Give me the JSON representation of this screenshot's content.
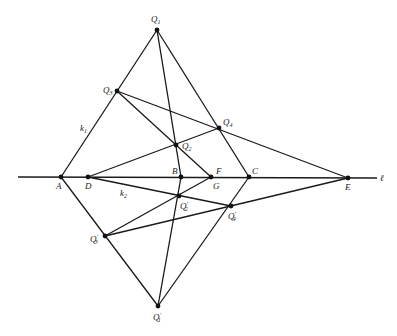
{
  "diagram": {
    "type": "projective-geometry-construction",
    "line_label": "ℓ",
    "line_names": {
      "k1": "k",
      "k1_sub": "1",
      "k2": "k",
      "k2_sub": "2"
    },
    "points": [
      {
        "id": "Q1",
        "label": "Q",
        "sub": "1",
        "prime": "",
        "x": 157,
        "y": 30
      },
      {
        "id": "Q3",
        "label": "Q",
        "sub": "3",
        "prime": "",
        "x": 117,
        "y": 91
      },
      {
        "id": "Q4",
        "label": "Q",
        "sub": "4",
        "prime": "",
        "x": 219,
        "y": 128
      },
      {
        "id": "Q2",
        "label": "Q",
        "sub": "2",
        "prime": "",
        "x": 176,
        "y": 145
      },
      {
        "id": "A",
        "label": "A",
        "sub": "",
        "prime": "",
        "x": 61,
        "y": 177
      },
      {
        "id": "D",
        "label": "D",
        "sub": "",
        "prime": "",
        "x": 88,
        "y": 177
      },
      {
        "id": "B",
        "label": "B",
        "sub": "",
        "prime": "",
        "x": 181,
        "y": 177
      },
      {
        "id": "F",
        "label": "F",
        "sub": "",
        "prime": "",
        "x": 211,
        "y": 177
      },
      {
        "id": "C",
        "label": "C",
        "sub": "",
        "prime": "",
        "x": 249,
        "y": 177
      },
      {
        "id": "E",
        "label": "E",
        "sub": "",
        "prime": "",
        "x": 348,
        "y": 178
      },
      {
        "id": "Q2p",
        "label": "Q",
        "sub": "2",
        "prime": "′",
        "x": 179,
        "y": 196
      },
      {
        "id": "Q4p",
        "label": "Q",
        "sub": "4",
        "prime": "′",
        "x": 231,
        "y": 206
      },
      {
        "id": "Q3p",
        "label": "Q",
        "sub": "3",
        "prime": "′",
        "x": 105,
        "y": 236
      },
      {
        "id": "Q1p",
        "label": "Q",
        "sub": "1",
        "prime": "′",
        "x": 158,
        "y": 306
      }
    ],
    "extra_labels": [
      {
        "id": "G",
        "text": "G"
      }
    ],
    "segments": [
      [
        "l_start",
        "l_end"
      ],
      [
        "A",
        "Q1"
      ],
      [
        "Q1",
        "B"
      ],
      [
        "Q1",
        "C"
      ],
      [
        "Q3",
        "F"
      ],
      [
        "Q3",
        "E"
      ],
      [
        "D",
        "Q4"
      ],
      [
        "A",
        "Q1p"
      ],
      [
        "Q1p",
        "B"
      ],
      [
        "Q1p",
        "C"
      ],
      [
        "Q3p",
        "F"
      ],
      [
        "Q3p",
        "E"
      ],
      [
        "D",
        "Q4p"
      ]
    ]
  }
}
